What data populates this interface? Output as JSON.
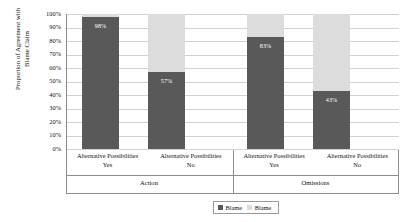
{
  "chart_data": {
    "type": "bar",
    "title": "",
    "xlabel": "",
    "ylabel": "Proportion of Agreement with Blame Claim",
    "ylabel_line1": "Proportion of Agreement with",
    "ylabel_line2": "Blame Claim",
    "ylim": [
      0,
      100
    ],
    "grid": true,
    "stacked": true,
    "legend_position": "bottom-right",
    "ytick_labels": [
      "100%",
      "90%",
      "80%",
      "70%",
      "60%",
      "50%",
      "40%",
      "30%",
      "20%",
      "10%",
      "0%"
    ],
    "ytick_values": [
      100,
      90,
      80,
      70,
      60,
      50,
      40,
      30,
      20,
      10,
      0
    ],
    "groups": [
      {
        "name": "Action",
        "categories": [
          {
            "line1": "Alternative Possibilities",
            "line2": "Yes"
          },
          {
            "line1": "Alternative Possibilities",
            "line2": "No"
          }
        ]
      },
      {
        "name": "Omissions",
        "categories": [
          {
            "line1": "Alternative Possibilities",
            "line2": "Yes"
          },
          {
            "line1": "Alternative Possibilities",
            "line2": "No"
          }
        ]
      }
    ],
    "categories": [
      "Action / Alternative Possibilities Yes",
      "Action / Alternative Possibilities No",
      "Omissions / Alternative Possibilities Yes",
      "Omissions / Alternative Possibilities No"
    ],
    "series": [
      {
        "name": "Blame",
        "color": "#595959",
        "values": [
          98,
          57,
          83,
          43
        ],
        "labels": [
          "98%",
          "57%",
          "83%",
          "43%"
        ]
      },
      {
        "name": "Blame",
        "color": "#dcdcdc",
        "values": [
          2,
          43,
          17,
          57
        ],
        "labels": [
          "",
          "",
          "",
          ""
        ]
      }
    ],
    "legend": [
      {
        "label": "Blame",
        "color": "#595959",
        "swatch": "dark"
      },
      {
        "label": "Blame",
        "color": "#dcdcdc",
        "swatch": "light"
      }
    ]
  }
}
